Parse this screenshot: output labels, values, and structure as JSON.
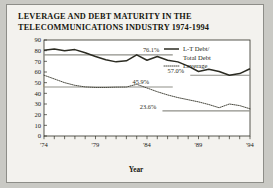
{
  "figure": {
    "title": "LEVERAGE AND DEBT MATURITY IN THE TELECOMMUNICATIONS INDUSTRY 1974-1994",
    "background": "#f3f2ee",
    "page_background": "#c9c9c4"
  },
  "chart_data": {
    "type": "line",
    "title": "LEVERAGE AND DEBT MATURITY IN THE TELECOMMUNICATIONS INDUSTRY 1974-1994",
    "xlabel": "Year",
    "ylabel": "Percentage",
    "ylim": [
      0,
      90
    ],
    "yticks": [
      0,
      10,
      20,
      30,
      40,
      50,
      60,
      70,
      80,
      90
    ],
    "ytick_labels": [
      "0",
      "10",
      "20",
      "30",
      "40",
      "50",
      "60",
      "70",
      "80",
      "90"
    ],
    "xlim": [
      1974,
      1994
    ],
    "xticks": [
      1974,
      1979,
      1984,
      1989,
      1994
    ],
    "xtick_labels": [
      "'74",
      "'79",
      "'84",
      "'89",
      "'94"
    ],
    "x": [
      1974,
      1975,
      1976,
      1977,
      1978,
      1979,
      1980,
      1981,
      1982,
      1983,
      1984,
      1985,
      1986,
      1987,
      1988,
      1989,
      1990,
      1991,
      1992,
      1993,
      1994
    ],
    "grid": false,
    "legend_position": "upper right",
    "series": [
      {
        "name": "L-T Debt/ Total Debt",
        "style": "solid",
        "color": "#2b2b22",
        "values": [
          80.5,
          81.5,
          80.0,
          81.0,
          78.0,
          74.5,
          71.5,
          69.5,
          70.5,
          76.1,
          71.0,
          74.5,
          71.0,
          69.5,
          65.5,
          60.5,
          62.5,
          60.5,
          57.0,
          58.5,
          63.0
        ]
      },
      {
        "name": "Leverage",
        "style": "dotted",
        "color": "#4a4a40",
        "values": [
          57.0,
          53.5,
          50.0,
          47.5,
          46.0,
          45.5,
          45.5,
          45.8,
          45.9,
          48.5,
          45.0,
          41.5,
          38.5,
          36.0,
          34.0,
          32.0,
          29.5,
          26.5,
          30.0,
          28.5,
          25.5
        ]
      }
    ],
    "reference_lines": [
      {
        "label": "76.1%",
        "value": 76.1,
        "series": "L-T Debt/ Total Debt"
      },
      {
        "label": "57.0%",
        "value": 57.0,
        "series": "L-T Debt/ Total Debt"
      },
      {
        "label": "45.9%",
        "value": 45.9,
        "series": "Leverage"
      },
      {
        "label": "23.6%",
        "value": 23.6,
        "series": "Leverage"
      }
    ],
    "annotations": [
      {
        "text": "76.1%",
        "value": 76.1
      },
      {
        "text": "57.0%",
        "value": 57.0
      },
      {
        "text": "45.9%",
        "value": 45.9
      },
      {
        "text": "23.6%",
        "value": 23.6
      }
    ],
    "legend": [
      {
        "label_line1": "L-T Debt/",
        "label_line2": "Total Debt",
        "style": "solid"
      },
      {
        "label_line1": "Leverage",
        "label_line2": "",
        "style": "dotted"
      }
    ]
  }
}
